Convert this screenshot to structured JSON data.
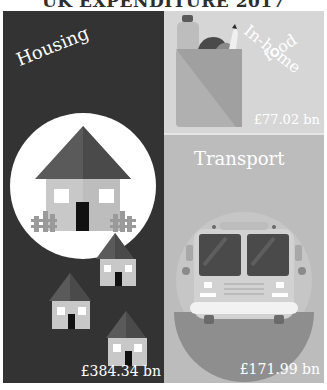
{
  "title": "UK EXPENDITURE 2017",
  "panels": {
    "housing": {
      "label": "Housing",
      "value": "£384.34 bn",
      "icon": "house-icon"
    },
    "food": {
      "label_line1": "In-home",
      "label_line2": "food",
      "value": "£77.02 bn",
      "icon": "grocery-bag-icon"
    },
    "transport": {
      "label": "Transport",
      "value": "£171.99 bn",
      "icon": "bus-icon"
    }
  },
  "colors": {
    "housing_bg": "#333333",
    "food_bg": "#d6d6d6",
    "transport_bg": "#bcbcbc",
    "text": "#ffffff"
  }
}
